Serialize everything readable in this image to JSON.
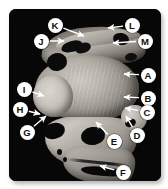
{
  "figure": {
    "type": "labeled-anatomical-mri-figure",
    "modality": "mri-grayscale-sagittal-slice",
    "panel_background": "#050505",
    "callout_fill": "#ffffff",
    "callout_text_color": "#111111",
    "arrow_color": "#ffffff",
    "page_background": "#ffffff"
  },
  "callouts": [
    {
      "id": "A",
      "label": "A",
      "cx": 148,
      "cy": 75,
      "tip_x": 124,
      "tip_y": 74,
      "side": "right"
    },
    {
      "id": "B",
      "label": "B",
      "cx": 148,
      "cy": 98,
      "tip_x": 124,
      "tip_y": 97,
      "side": "right"
    },
    {
      "id": "C",
      "label": "C",
      "cx": 147,
      "cy": 112,
      "tip_x": 125,
      "tip_y": 108,
      "side": "right"
    },
    {
      "id": "D",
      "label": "D",
      "cx": 137,
      "cy": 135,
      "tip_x": 126,
      "tip_y": 116,
      "side": "right"
    },
    {
      "id": "E",
      "label": "E",
      "cx": 114,
      "cy": 141,
      "tip_x": 96,
      "tip_y": 122,
      "side": "right"
    },
    {
      "id": "F",
      "label": "F",
      "cx": 123,
      "cy": 172,
      "tip_x": 100,
      "tip_y": 166,
      "side": "right"
    },
    {
      "id": "G",
      "label": "G",
      "cx": 27,
      "cy": 132,
      "tip_x": 46,
      "tip_y": 116,
      "side": "left"
    },
    {
      "id": "H",
      "label": "H",
      "cx": 20,
      "cy": 109,
      "tip_x": 40,
      "tip_y": 114,
      "side": "left"
    },
    {
      "id": "I",
      "label": "I",
      "cx": 24,
      "cy": 89,
      "tip_x": 44,
      "tip_y": 96,
      "side": "left"
    },
    {
      "id": "J",
      "label": "J",
      "cx": 41,
      "cy": 41,
      "tip_x": 64,
      "tip_y": 41,
      "side": "left"
    },
    {
      "id": "K",
      "label": "K",
      "cx": 55,
      "cy": 25,
      "tip_x": 84,
      "tip_y": 36,
      "side": "left"
    },
    {
      "id": "L",
      "label": "L",
      "cx": 132,
      "cy": 25,
      "tip_x": 108,
      "tip_y": 28,
      "side": "right"
    },
    {
      "id": "M",
      "label": "M",
      "cx": 145,
      "cy": 41,
      "tip_x": 113,
      "tip_y": 43,
      "side": "right"
    }
  ]
}
